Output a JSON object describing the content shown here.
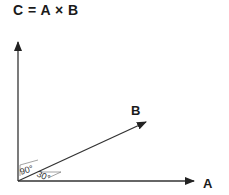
{
  "title": "C = A × B",
  "vectors": {
    "a": {
      "label": "A"
    },
    "b": {
      "label": "B"
    },
    "c": {
      "label": ""
    }
  },
  "angles": {
    "right_angle": "90°",
    "ab_angle": "30°"
  },
  "colors": {
    "line": "#333333",
    "text": "#1a1a1a"
  }
}
